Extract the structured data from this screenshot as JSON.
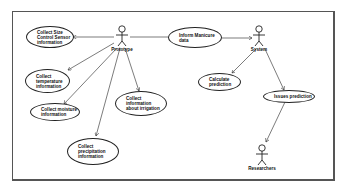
{
  "diagram": {
    "type": "UML use case diagram",
    "actors": [
      {
        "id": "prototype",
        "label": "Prototype"
      },
      {
        "id": "system",
        "label": "System"
      },
      {
        "id": "researchers",
        "label": "Researchers"
      }
    ],
    "use_cases": [
      {
        "id": "uc1",
        "label": "Collect Size\nControl Sensor\ninformation"
      },
      {
        "id": "uc2",
        "label": "Collect\ntemperature\ninformation"
      },
      {
        "id": "uc3",
        "label": "Collect moisture\ninformation"
      },
      {
        "id": "uc4",
        "label": "Collect\nprecipitation\ninformation"
      },
      {
        "id": "uc5",
        "label": "Collect information\nabout irrigation"
      },
      {
        "id": "uc6",
        "label": "Inform Manicure\ndata"
      },
      {
        "id": "uc7",
        "label": "Calculate\nprediction"
      },
      {
        "id": "uc8",
        "label": "Issues prediction"
      }
    ],
    "relations": [
      {
        "from": "prototype",
        "to": "uc1"
      },
      {
        "from": "prototype",
        "to": "uc2"
      },
      {
        "from": "prototype",
        "to": "uc3"
      },
      {
        "from": "prototype",
        "to": "uc4"
      },
      {
        "from": "prototype",
        "to": "uc5"
      },
      {
        "from": "uc6",
        "to": "system"
      },
      {
        "from": "system",
        "to": "uc7"
      },
      {
        "from": "system",
        "to": "uc8"
      },
      {
        "from": "uc8",
        "to": "researchers"
      }
    ]
  }
}
